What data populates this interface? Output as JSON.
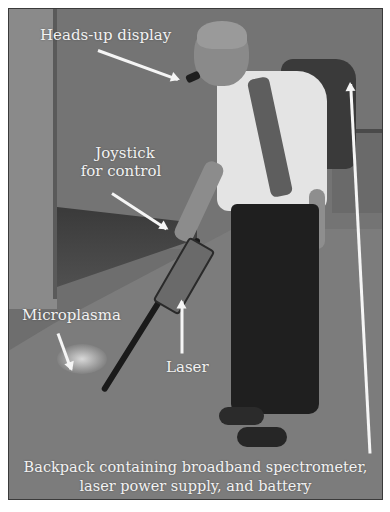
{
  "figure": {
    "labels": {
      "heads_up_display": "Heads-up display",
      "joystick_line1": "Joystick",
      "joystick_line2": "for control",
      "microplasma": "Microplasma",
      "laser": "Laser",
      "backpack_line1": "Backpack containing broadband spectrometer,",
      "backpack_line2": "laser power supply, and battery"
    },
    "colors": {
      "label_text": "#f2f2f2",
      "arrow": "#f5f5f5",
      "background": "#ffffff"
    }
  }
}
